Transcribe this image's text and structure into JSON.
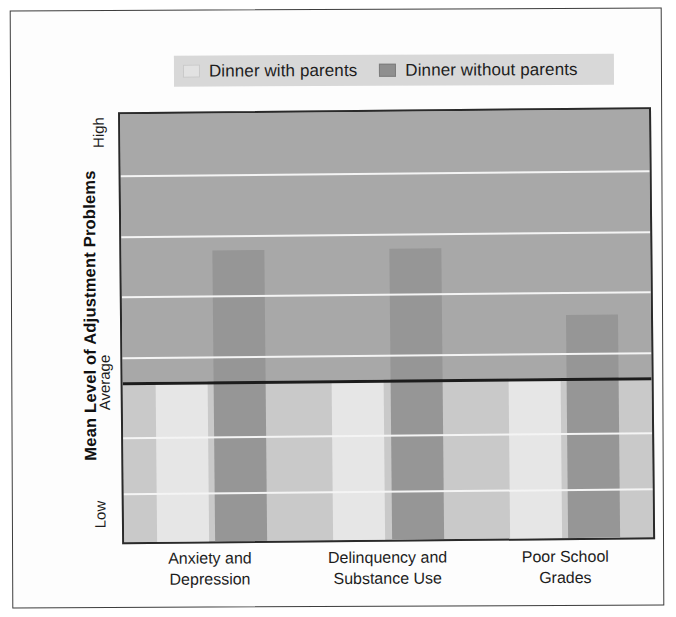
{
  "chart_data": {
    "type": "bar",
    "title": "",
    "subtitle": "",
    "xlabel": "",
    "ylabel": "Mean Level of Adjustment Problems",
    "categories": [
      "Anxiety and Depression",
      "Delinquency and Substance Use",
      "Poor School Grades"
    ],
    "category_lines": [
      [
        "Anxiety and",
        "Depression"
      ],
      [
        "Delinquency and",
        "Substance Use"
      ],
      [
        "Poor School",
        "Grades"
      ]
    ],
    "series": [
      {
        "name": "Dinner with parents",
        "color": "#e6e6e6",
        "values": [
          0.0,
          0.0,
          0.0
        ]
      },
      {
        "name": "Dinner without parents",
        "color": "#969696",
        "values": [
          0.49,
          0.49,
          0.235
        ]
      }
    ],
    "ytick_labels": [
      "High",
      "Average",
      "Low"
    ],
    "ytick_values": [
      1.0,
      0.0,
      -1.0
    ],
    "ylim": [
      -1.0,
      1.0
    ],
    "reference_line": {
      "label": "Average",
      "value": 0.0
    },
    "gridlines_upper_fraction": [
      0.142,
      0.284,
      0.426,
      0.568
    ],
    "gridlines_lower_fraction": [
      0.755,
      0.885
    ],
    "grid": true,
    "legend_position": "top"
  },
  "legend": {
    "items": [
      {
        "label": "Dinner with parents",
        "swatch": "legend-swatch-light"
      },
      {
        "label": "Dinner without parents",
        "swatch": "legend-swatch-dark"
      }
    ]
  },
  "axis": {
    "y_title": "Mean Level of Adjustment Problems",
    "y_high": "High",
    "y_average": "Average",
    "y_low": "Low"
  },
  "colors": {
    "band_upper": "#a8a8a8",
    "band_lower": "#c9c9c9",
    "bar_light": "#e6e6e6",
    "bar_dark": "#969696",
    "gridline": "#f4f4f4",
    "average_line": "#1c1c1c",
    "legend_bg": "#d8d8d8",
    "frame_border": "#3d3d3d"
  }
}
